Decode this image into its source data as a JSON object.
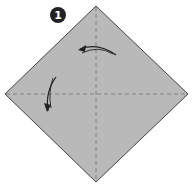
{
  "step": {
    "number": "1",
    "badge_color": "#222222"
  },
  "paper": {
    "shape": "square rotated 45 degrees (diamond)",
    "fill_color": "#b9b9b9",
    "edge_color": "#444444"
  },
  "creases": [
    {
      "type": "valley-fold-dashed",
      "orientation": "vertical"
    },
    {
      "type": "valley-fold-dashed",
      "orientation": "horizontal"
    }
  ],
  "arrows": [
    {
      "name": "fold-arrow-top",
      "direction": "curving left"
    },
    {
      "name": "fold-arrow-left",
      "direction": "curving down"
    }
  ]
}
